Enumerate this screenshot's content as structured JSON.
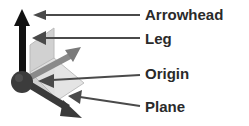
{
  "diagram": {
    "title": "",
    "parts": {
      "vertical_axis": "Black arrow pointing up",
      "depth_axis": "Gray arrow pointing up-right",
      "horizontal_axis": "Dark gray arrow pointing down-right",
      "origin": "Dark sphere at axis intersection",
      "plane": "Translucent light gray planes between axes"
    },
    "callouts": [
      {
        "label": "Arrowhead",
        "target": "top of vertical arrow"
      },
      {
        "label": "Leg",
        "target": "vertical arrow shaft"
      },
      {
        "label": "Origin",
        "target": "center sphere"
      },
      {
        "label": "Plane",
        "target": "translucent plane"
      }
    ]
  },
  "colors": {
    "vertical_axis": "#111111",
    "depth_axis": "#7a7a7a",
    "horizontal_axis": "#3a3a3a",
    "origin": "#3c3c3c",
    "plane": "#d6d6d6",
    "plane_edge": "#b5b5b5",
    "callout_line": "#4a4a4a",
    "label_text": "#2a2a2a"
  }
}
